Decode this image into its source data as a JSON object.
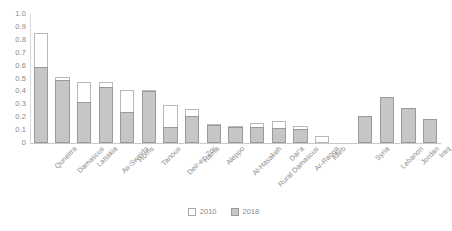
{
  "chart_data": {
    "type": "bar",
    "title": "",
    "subtitle": "",
    "xlabel": "",
    "ylabel": "",
    "ylim": [
      0,
      1.0
    ],
    "ytick_labels": [
      "1.0",
      "0.9",
      "0.8",
      "0.7",
      "0.6",
      "0.5",
      "0.4",
      "0.3",
      "0.2",
      "0.1",
      "0"
    ],
    "ytick_values": [
      1.0,
      0.9,
      0.8,
      0.7,
      0.6,
      0.5,
      0.4,
      0.3,
      0.2,
      0.1,
      0
    ],
    "grid": false,
    "legend_position": "bottom-center",
    "bar_style": "overlaid",
    "categories": [
      "Quneitra",
      "Damascus",
      "Lattakia",
      "As-Sweida",
      "Homs",
      "Tartous",
      "Deir-ez-Zor",
      "Hama",
      "Aleppo",
      "Al-Hasakeh",
      "Rural Damascus",
      "Dar'a",
      "Ar-Raqqa",
      "Idleb",
      "",
      "Syria",
      "Lebanon",
      "Jordan",
      "Iraq"
    ],
    "series": [
      {
        "name": "2010",
        "color": "#ffffff",
        "edge_color": "#b9b9b9",
        "values": [
          0.855,
          0.51,
          0.47,
          0.47,
          0.41,
          0.41,
          0.295,
          0.265,
          0.15,
          0.135,
          0.155,
          0.17,
          0.13,
          0.055,
          null,
          null,
          null,
          null,
          null
        ]
      },
      {
        "name": "2018",
        "color": "#c6c6c6",
        "edge_color": "#9a9a9a",
        "values": [
          0.59,
          0.487,
          0.32,
          0.437,
          0.237,
          0.403,
          0.123,
          0.213,
          0.14,
          0.128,
          0.122,
          0.118,
          0.105,
          0.0,
          null,
          0.21,
          0.355,
          0.275,
          0.19
        ]
      }
    ],
    "legend": [
      {
        "label": "2010",
        "swatch": "white-outlined-square"
      },
      {
        "label": "2018",
        "swatch": "gray-filled-square"
      }
    ]
  },
  "colors": {
    "series_2010_fill": "#ffffff",
    "series_2010_edge": "#b9b9b9",
    "series_2018_fill": "#c6c6c6",
    "series_2018_edge": "#9a9a9a",
    "axis": "#c9c9c9",
    "text": "#8a8a8a",
    "background": "#ffffff"
  }
}
